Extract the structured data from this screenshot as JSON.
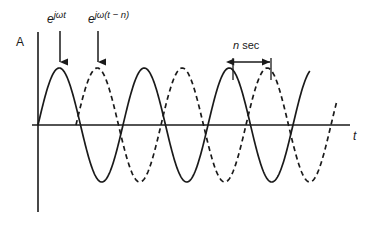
{
  "figure": {
    "type": "signal-phase-shift-diagram",
    "axes": {
      "y_label": "A",
      "x_label": "t",
      "origin_x": 38,
      "baseline_y": 125,
      "x_axis_start": 32,
      "x_axis_end": 350,
      "y_axis_top": 32,
      "y_axis_bottom": 212
    },
    "annotations": {
      "expr_solid": {
        "base": "e",
        "exponent": "jωt"
      },
      "expr_dashed": {
        "base": "e",
        "exponent": "jω(t − n)"
      },
      "interval_label_italic": "n",
      "interval_label_rest": " sec"
    },
    "colors": {
      "stroke": "#1a1a1a",
      "background": "#ffffff"
    }
  },
  "chart_data": {
    "type": "line",
    "title": "",
    "xlabel": "t",
    "ylabel": "A",
    "grid": false,
    "legend": "none",
    "xlim": [
      0,
      312
    ],
    "ylim": [
      -1,
      1
    ],
    "series": [
      {
        "name": "e^{jωt}",
        "style": "solid",
        "amplitude": 1,
        "period_px": 85,
        "phase_shift_px": 0,
        "start_px": 0,
        "end_px": 272,
        "peaks_px": [
          21,
          106,
          191
        ],
        "troughs_px": [
          64,
          149,
          234
        ],
        "zero_crossings_px": [
          0,
          43,
          85,
          128,
          170,
          213,
          255
        ]
      },
      {
        "name": "e^{jω(t−n)}",
        "style": "dashed",
        "amplitude": 1,
        "period_px": 85,
        "phase_shift_px": 38,
        "start_px": 38,
        "end_px": 299,
        "peaks_px": [
          59,
          144,
          229
        ],
        "troughs_px": [
          102,
          187,
          272
        ],
        "zero_crossings_px": [
          38,
          81,
          123,
          166,
          208,
          251,
          293
        ]
      }
    ],
    "annotations": [
      {
        "type": "arrow-down",
        "label": "e^{jωt}",
        "x_px": 60,
        "points_to": "first solid peak"
      },
      {
        "type": "arrow-down",
        "label": "e^{jω(t−n)}",
        "x_px": 98,
        "points_to": "first dashed peak"
      },
      {
        "type": "double-arrow-horizontal",
        "label": "n sec",
        "from_x_px": 233,
        "to_x_px": 271,
        "y_px": 62,
        "measures": "time delay between solid and dashed peaks"
      }
    ]
  }
}
